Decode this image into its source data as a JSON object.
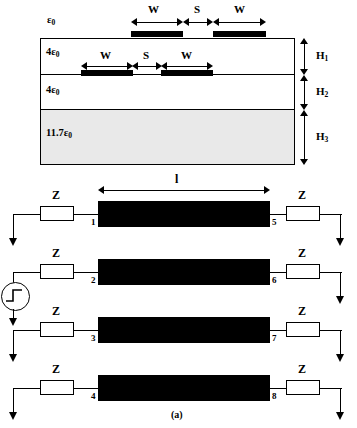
{
  "figure": {
    "caption": "(a)",
    "title_note": "Multilayer coupled microstrip cross-section and equivalent eight-port circuit"
  },
  "cross_section": {
    "layers": [
      {
        "name": "air-region",
        "permittivity": "ε0",
        "eps_prefix": "",
        "eps_sub": "0",
        "fill": "#ffffff",
        "height_label": ""
      },
      {
        "name": "dielectric-layer-1",
        "permittivity": "4ε0",
        "eps_prefix": "4",
        "eps_sub": "0",
        "fill": "#ffffff",
        "height_label": "H1"
      },
      {
        "name": "dielectric-layer-2",
        "permittivity": "4ε0",
        "eps_prefix": "4",
        "eps_sub": "0",
        "fill": "#ffffff",
        "height_label": "H2"
      },
      {
        "name": "substrate-layer",
        "permittivity": "11.7ε0",
        "eps_prefix": "11.7",
        "eps_sub": "0",
        "fill": "#e9e9e9",
        "height_label": "H3"
      }
    ],
    "eps_air": {
      "prefix": "",
      "sub": "0"
    },
    "eps_l1": {
      "prefix": "4",
      "sub": "0"
    },
    "eps_l2": {
      "prefix": "4",
      "sub": "0"
    },
    "eps_l3": {
      "prefix": "11.7",
      "sub": "0"
    },
    "height_labels": [
      {
        "base": "H",
        "sub": "1"
      },
      {
        "base": "H",
        "sub": "2"
      },
      {
        "base": "H",
        "sub": "3"
      }
    ],
    "top_dims": [
      "W",
      "S",
      "W"
    ],
    "embedded_dims": [
      "W",
      "S",
      "W"
    ],
    "conductor_color": "#000000",
    "outline_color": "#000000"
  },
  "circuit": {
    "length_label": "l",
    "impedance_label": "Z",
    "source_name": "step-voltage-source",
    "rows": [
      {
        "left_port": "1",
        "right_port": "5",
        "left_z": "Z",
        "right_z": "Z",
        "has_source": false
      },
      {
        "left_port": "2",
        "right_port": "6",
        "left_z": "Z",
        "right_z": "Z",
        "has_source": true
      },
      {
        "left_port": "3",
        "right_port": "7",
        "left_z": "Z",
        "right_z": "Z",
        "has_source": false
      },
      {
        "left_port": "4",
        "right_port": "8",
        "left_z": "Z",
        "right_z": "Z",
        "has_source": false
      }
    ]
  }
}
